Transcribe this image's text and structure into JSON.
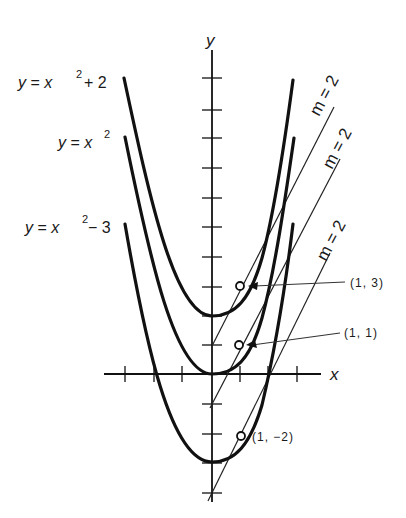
{
  "figure": {
    "axes": {
      "x_label": "x",
      "y_label": "y"
    },
    "curves": [
      {
        "name": "y = x^2 + 2",
        "label_main": "y = x",
        "label_exp": "2",
        "label_tail": " + 2"
      },
      {
        "name": "y = x^2",
        "label_main": "y = x",
        "label_exp": "2",
        "label_tail": ""
      },
      {
        "name": "y = x^2 - 3",
        "label_main": "y = x",
        "label_exp": "2",
        "label_tail": " − 3"
      }
    ],
    "tangents": [
      {
        "slope_label": "m = 2",
        "equation": "y = 2x + 1"
      },
      {
        "slope_label": "m = 2",
        "equation": "y = 2x − 1"
      },
      {
        "slope_label": "m = 2",
        "equation": "y = 2x − 4"
      }
    ],
    "points": [
      {
        "label": "(1, 3)"
      },
      {
        "label": "(1, 1)"
      },
      {
        "label": "(1, −2)"
      }
    ]
  },
  "colors": {
    "ink": "#111111",
    "background": "#ffffff"
  }
}
